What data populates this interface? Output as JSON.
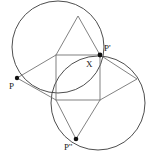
{
  "figure": {
    "kind": "geometry-diagram",
    "canvas": {
      "width": 153,
      "height": 165
    },
    "colors": {
      "background": "#ffffff",
      "circle_stroke": "#3a3a3a",
      "segment_stroke": "#6b6b6b",
      "square_stroke": "#6b6b6b",
      "point_fill": "#111111",
      "label_text": "#1a1a1a"
    },
    "labels": [
      {
        "id": "label-P",
        "text": "P",
        "x": 9,
        "y": 82
      },
      {
        "id": "label-Pprime",
        "text": "P'",
        "x": 104,
        "y": 44
      },
      {
        "id": "label-X",
        "text": "X",
        "x": 86,
        "y": 60
      },
      {
        "id": "label-Pdoubleprime",
        "text": "P''",
        "x": 64,
        "y": 143
      }
    ],
    "points": [
      {
        "id": "point-P",
        "label": "P",
        "x": 17,
        "y": 78,
        "r": 2.2
      },
      {
        "id": "point-Pprime",
        "label": "P'",
        "x": 100,
        "y": 55,
        "r": 2.4
      },
      {
        "id": "point-Pdoubleprime",
        "label": "P''",
        "x": 76,
        "y": 139,
        "r": 2.3
      }
    ],
    "circles": [
      {
        "id": "circle-upper-left",
        "cx": 58,
        "cy": 47,
        "r": 46,
        "note": "passes through P, top apex and P'"
      },
      {
        "id": "circle-lower-right",
        "cx": 98,
        "cy": 103,
        "r": 47,
        "note": "passes through P', right vertex and P''"
      }
    ],
    "square": {
      "id": "center-square",
      "x": 56,
      "y": 55,
      "width": 44,
      "height": 45,
      "corners": [
        {
          "x": 56,
          "y": 55
        },
        {
          "x": 100,
          "y": 55
        },
        {
          "x": 100,
          "y": 100
        },
        {
          "x": 56,
          "y": 100
        }
      ]
    },
    "apexes": [
      {
        "id": "apex-top",
        "x": 78,
        "y": 16
      },
      {
        "id": "apex-right",
        "x": 137,
        "y": 79
      }
    ],
    "segments": [
      {
        "id": "seg-P-to-square-topleft",
        "x1": 17,
        "y1": 78,
        "x2": 56,
        "y2": 55
      },
      {
        "id": "seg-P-to-square-bottomleft",
        "x1": 17,
        "y1": 78,
        "x2": 56,
        "y2": 100
      },
      {
        "id": "seg-apextop-to-square-topleft",
        "x1": 78,
        "y1": 16,
        "x2": 56,
        "y2": 55
      },
      {
        "id": "seg-apextop-to-Pprime",
        "x1": 78,
        "y1": 16,
        "x2": 100,
        "y2": 55
      },
      {
        "id": "seg-apexright-to-Pprime",
        "x1": 137,
        "y1": 79,
        "x2": 100,
        "y2": 55
      },
      {
        "id": "seg-apexright-to-square-bottomright",
        "x1": 137,
        "y1": 79,
        "x2": 100,
        "y2": 100
      },
      {
        "id": "seg-Pdoubleprime-to-square-bottomleft",
        "x1": 76,
        "y1": 139,
        "x2": 56,
        "y2": 100
      },
      {
        "id": "seg-Pdoubleprime-to-square-bottomright",
        "x1": 76,
        "y1": 139,
        "x2": 100,
        "y2": 100
      }
    ]
  }
}
